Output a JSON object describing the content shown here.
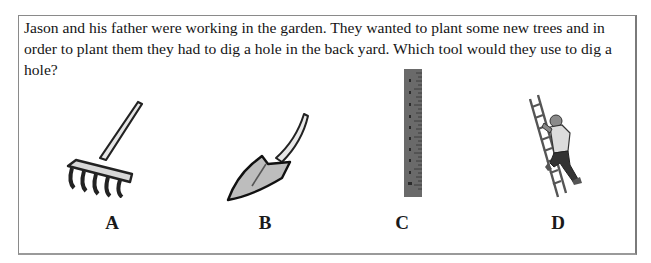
{
  "question": {
    "text": "Jason and his father were working in the garden. They wanted to plant some new trees and in order to plant them they had to dig a hole in the back yard. Which tool would they use to dig a hole?"
  },
  "options": [
    {
      "label": "A",
      "icon": "rake-icon"
    },
    {
      "label": "B",
      "icon": "shovel-icon"
    },
    {
      "label": "C",
      "icon": "ruler-icon"
    },
    {
      "label": "D",
      "icon": "ladder-climber-icon"
    }
  ],
  "colors": {
    "border": "#8a8a8a",
    "text": "#151515"
  }
}
